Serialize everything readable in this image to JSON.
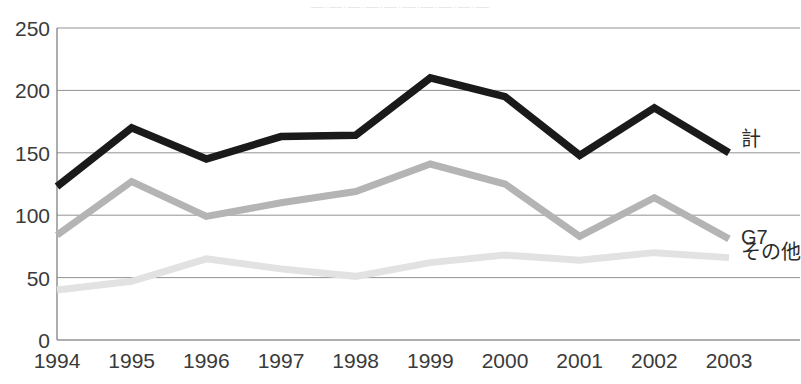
{
  "title_remnant": "—·—·—·—·—·—·—·—·—·—",
  "axis": {
    "y_ticks": [
      "0",
      "50",
      "100",
      "150",
      "200",
      "250"
    ],
    "x_ticks": [
      "1994",
      "1995",
      "1996",
      "1997",
      "1998",
      "1999",
      "2000",
      "2001",
      "2002",
      "2003"
    ]
  },
  "series_labels": {
    "total": "計",
    "g7": "G7",
    "other": "その他"
  },
  "colors": {
    "total": "#1a1a1a",
    "g7": "#b4b4b4",
    "other": "#e2e2e2",
    "grid": "#808080",
    "text": "#3a3a3a"
  },
  "chart_data": {
    "type": "line",
    "title": "",
    "xlabel": "",
    "ylabel": "",
    "ylim": [
      0,
      250
    ],
    "yticks": [
      0,
      50,
      100,
      150,
      200,
      250
    ],
    "grid": true,
    "legend_position": "right-end-of-line",
    "categories": [
      "1994",
      "1995",
      "1996",
      "1997",
      "1998",
      "1999",
      "2000",
      "2001",
      "2002",
      "2003"
    ],
    "series": [
      {
        "name": "計",
        "color": "#1a1a1a",
        "values": [
          123,
          170,
          145,
          163,
          164,
          210,
          195,
          148,
          186,
          150
        ]
      },
      {
        "name": "G7",
        "color": "#b4b4b4",
        "values": [
          84,
          127,
          99,
          110,
          119,
          141,
          125,
          83,
          114,
          81
        ]
      },
      {
        "name": "その他",
        "color": "#e2e2e2",
        "values": [
          40,
          47,
          65,
          57,
          51,
          62,
          68,
          64,
          70,
          66
        ]
      }
    ]
  }
}
